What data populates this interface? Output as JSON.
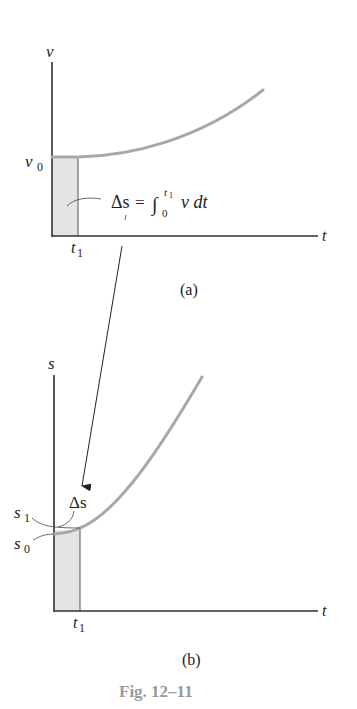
{
  "figure": {
    "caption": "Fig. 12–11",
    "caption_color": "#9a9a9a",
    "curve_color": "#a8a8a8",
    "shade_color": "#e4e4e4",
    "panel_a": {
      "label": "(a)",
      "y_axis_label": "v",
      "x_axis_label": "t",
      "y_intercept_label_base": "v",
      "y_intercept_label_sub": "0",
      "x_marker_label_base": "t",
      "x_marker_label_sub": "1",
      "annotation": {
        "lhs": "Δs",
        "equals": "=",
        "integral": "∫",
        "lower_limit": "0",
        "upper_limit_base": "t",
        "upper_limit_sub": "1",
        "integrand": "v dt"
      }
    },
    "panel_b": {
      "label": "(b)",
      "y_axis_label": "s",
      "x_axis_label": "t",
      "s1_label_base": "s",
      "s1_label_sub": "1",
      "s0_label_base": "s",
      "s0_label_sub": "0",
      "delta_label": "Δs",
      "x_marker_label_base": "t",
      "x_marker_label_sub": "1"
    }
  }
}
